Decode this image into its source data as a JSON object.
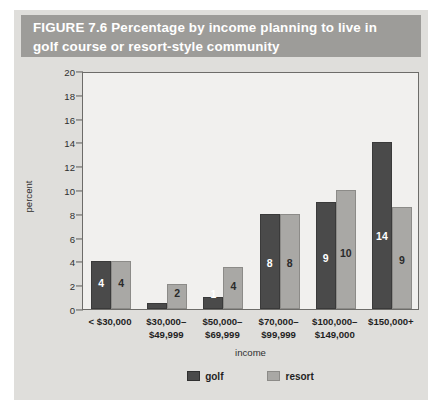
{
  "figure": {
    "label": "FIGURE 7.6",
    "title": "Percentage by income planning to live in golf course or resort-style community",
    "header_text": "FIGURE  7.6  Percentage by income planning to live in\ngolf course or resort-style community",
    "header_bg": "#9d9c99",
    "header_fg": "#ffffff",
    "card_bg": "#dfdedb",
    "plot_bg": "#f1f0ee"
  },
  "chart_data": {
    "type": "bar",
    "title": "Percentage by income planning to live in golf course or resort-style community",
    "xlabel": "income",
    "ylabel": "percent",
    "ylim": [
      0,
      20
    ],
    "ytick_step": 2,
    "yticks": [
      0,
      2,
      4,
      6,
      8,
      10,
      12,
      14,
      16,
      18,
      20
    ],
    "grid": false,
    "legend_position": "bottom-center",
    "categories": [
      "< $30,000",
      "$30,000–\n$49,999",
      "$50,000–\n$69,999",
      "$70,000–\n$99,999",
      "$100,000–\n$149,000",
      "$150,000+"
    ],
    "series": [
      {
        "name": "golf",
        "color": "#4a4a4a",
        "values": [
          4,
          0.5,
          1,
          8,
          9,
          14
        ],
        "labels": [
          "4",
          "",
          "1",
          "8",
          "9",
          "14"
        ]
      },
      {
        "name": "resort",
        "color": "#a9a8a5",
        "values": [
          4,
          2.1,
          3.5,
          8,
          10,
          8.6
        ],
        "labels": [
          "4",
          "2",
          "4",
          "8",
          "10",
          "9"
        ]
      }
    ]
  },
  "legend": {
    "items": [
      {
        "label": "golf",
        "color": "#4a4a4a"
      },
      {
        "label": "resort",
        "color": "#a9a8a5"
      }
    ]
  }
}
